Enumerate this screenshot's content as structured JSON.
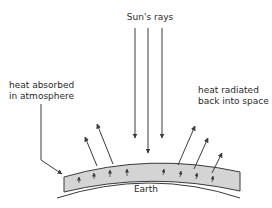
{
  "diagram": {
    "title_label": "Sun's rays",
    "left_label_line1": "heat absorbed",
    "left_label_line2": "in atmosphere",
    "right_label_line1": "heat radiated",
    "right_label_line2": "back into space",
    "earth_label": "Earth",
    "colors": {
      "line": "#3a3a3a",
      "atmosphere_fill": "#d4d4d4",
      "background": "#ffffff"
    }
  }
}
